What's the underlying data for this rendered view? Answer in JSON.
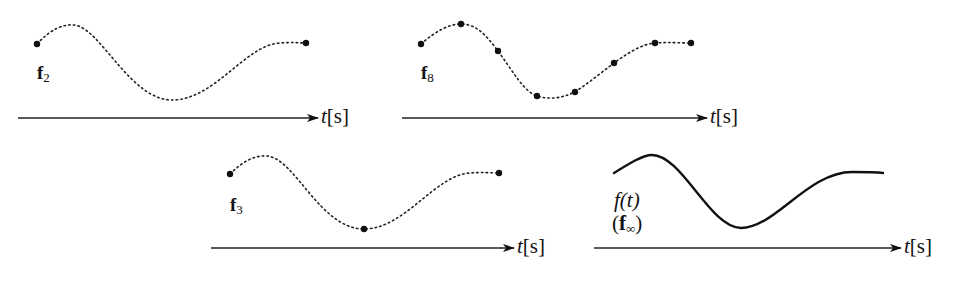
{
  "figure": {
    "panels": [
      {
        "id": "f2",
        "label_main": "f",
        "label_sub": "2",
        "curve_style": "dotted",
        "sample_points": 2,
        "axis_var": "t",
        "axis_unit": "[s]"
      },
      {
        "id": "f8",
        "label_main": "f",
        "label_sub": "8",
        "curve_style": "dotted",
        "sample_points": 8,
        "axis_var": "t",
        "axis_unit": "[s]"
      },
      {
        "id": "f3",
        "label_main": "f",
        "label_sub": "3",
        "curve_style": "dotted",
        "sample_points": 3,
        "axis_var": "t",
        "axis_unit": "[s]"
      },
      {
        "id": "finf",
        "label_func": "f(t)",
        "label_main": "f",
        "label_sub": "∞",
        "curve_style": "solid",
        "axis_var": "t",
        "axis_unit": "[s]"
      }
    ],
    "colors": {
      "ink": "#111111",
      "background": "#ffffff"
    }
  }
}
